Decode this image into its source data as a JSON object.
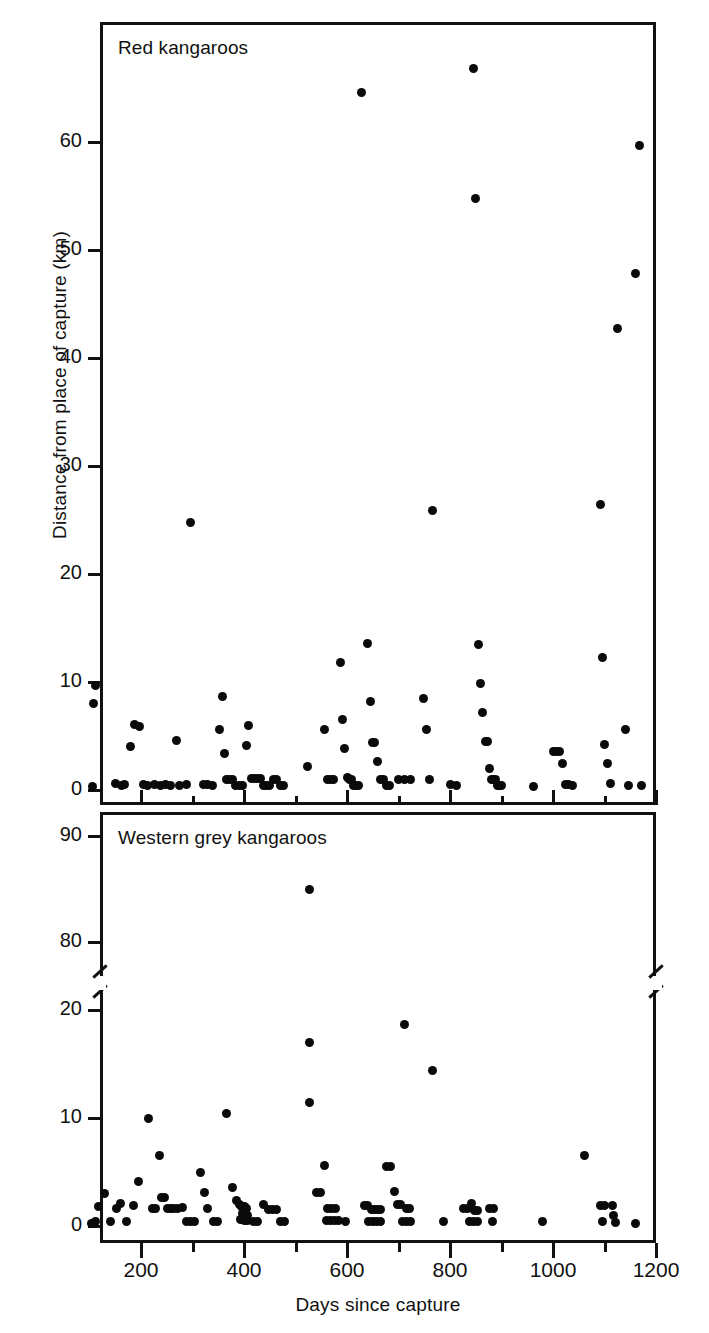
{
  "chart_data": {
    "type": "scatter",
    "title": "",
    "xlabel": "Days since capture",
    "ylabel": "Distance from place of capture (km)",
    "xlim": [
      100,
      1200
    ],
    "xticks": [
      200,
      400,
      600,
      800,
      1000,
      1200
    ],
    "xminorticks": [
      300,
      500,
      700,
      900,
      1100
    ],
    "grid": false,
    "legend_position": "none",
    "panels": [
      {
        "name": "red-kangaroos",
        "label": "Red kangaroos",
        "ylim": [
          0,
          68
        ],
        "yticks": [
          0,
          10,
          20,
          30,
          40,
          50,
          60
        ],
        "axis_break": false,
        "points": [
          [
            105,
            0.3
          ],
          [
            108,
            8.0
          ],
          [
            112,
            9.7
          ],
          [
            150,
            0.6
          ],
          [
            163,
            0.4
          ],
          [
            168,
            0.5
          ],
          [
            180,
            4.0
          ],
          [
            188,
            6.1
          ],
          [
            198,
            5.9
          ],
          [
            205,
            0.5
          ],
          [
            212,
            0.4
          ],
          [
            226,
            0.5
          ],
          [
            238,
            0.4
          ],
          [
            247,
            0.5
          ],
          [
            258,
            0.4
          ],
          [
            268,
            4.6
          ],
          [
            275,
            0.4
          ],
          [
            288,
            0.5
          ],
          [
            296,
            24.8
          ],
          [
            322,
            0.5
          ],
          [
            330,
            0.5
          ],
          [
            338,
            0.4
          ],
          [
            352,
            5.6
          ],
          [
            358,
            8.7
          ],
          [
            362,
            3.4
          ],
          [
            366,
            1.0
          ],
          [
            372,
            1.0
          ],
          [
            378,
            1.0
          ],
          [
            384,
            0.4
          ],
          [
            391,
            0.4
          ],
          [
            397,
            0.4
          ],
          [
            404,
            4.1
          ],
          [
            409,
            6.0
          ],
          [
            414,
            1.1
          ],
          [
            420,
            1.1
          ],
          [
            426,
            1.1
          ],
          [
            432,
            1.1
          ],
          [
            438,
            0.4
          ],
          [
            444,
            0.4
          ],
          [
            450,
            0.4
          ],
          [
            458,
            1.0
          ],
          [
            464,
            1.0
          ],
          [
            470,
            0.4
          ],
          [
            476,
            0.4
          ],
          [
            523,
            2.2
          ],
          [
            556,
            5.6
          ],
          [
            562,
            1.0
          ],
          [
            568,
            1.0
          ],
          [
            574,
            1.0
          ],
          [
            588,
            11.8
          ],
          [
            592,
            6.5
          ],
          [
            596,
            3.8
          ],
          [
            600,
            1.2
          ],
          [
            604,
            1.0
          ],
          [
            608,
            1.0
          ],
          [
            612,
            0.4
          ],
          [
            617,
            0.4
          ],
          [
            622,
            0.4
          ],
          [
            628,
            64.6
          ],
          [
            640,
            13.6
          ],
          [
            646,
            8.2
          ],
          [
            650,
            4.4
          ],
          [
            654,
            4.4
          ],
          [
            660,
            2.6
          ],
          [
            665,
            1.0
          ],
          [
            670,
            1.0
          ],
          [
            676,
            0.4
          ],
          [
            682,
            0.4
          ],
          [
            700,
            1.0
          ],
          [
            712,
            1.0
          ],
          [
            724,
            1.0
          ],
          [
            748,
            8.5
          ],
          [
            754,
            5.6
          ],
          [
            760,
            1.0
          ],
          [
            766,
            25.9
          ],
          [
            800,
            0.5
          ],
          [
            812,
            0.4
          ],
          [
            846,
            66.8
          ],
          [
            850,
            54.8
          ],
          [
            856,
            13.5
          ],
          [
            860,
            9.9
          ],
          [
            864,
            7.2
          ],
          [
            868,
            4.5
          ],
          [
            872,
            4.5
          ],
          [
            876,
            2.0
          ],
          [
            880,
            1.0
          ],
          [
            884,
            1.0
          ],
          [
            888,
            1.0
          ],
          [
            892,
            0.4
          ],
          [
            896,
            0.4
          ],
          [
            900,
            0.4
          ],
          [
            962,
            0.3
          ],
          [
            1000,
            3.6
          ],
          [
            1006,
            3.6
          ],
          [
            1012,
            3.6
          ],
          [
            1018,
            2.5
          ],
          [
            1024,
            0.5
          ],
          [
            1030,
            0.5
          ],
          [
            1038,
            0.4
          ],
          [
            1092,
            26.4
          ],
          [
            1096,
            12.3
          ],
          [
            1100,
            4.2
          ],
          [
            1106,
            2.5
          ],
          [
            1112,
            0.6
          ],
          [
            1126,
            42.7
          ],
          [
            1140,
            5.6
          ],
          [
            1146,
            0.4
          ],
          [
            1160,
            47.8
          ],
          [
            1168,
            59.7
          ],
          [
            1172,
            0.4
          ]
        ]
      },
      {
        "name": "western-grey-kangaroos",
        "label": "Western grey kangaroos",
        "ylim": [
          0,
          92
        ],
        "yticks": [
          0,
          10,
          20,
          80,
          90
        ],
        "axis_break": true,
        "break_between": [
          22,
          78
        ],
        "points": [
          [
            104,
            0.2
          ],
          [
            112,
            0.4
          ],
          [
            118,
            1.8
          ],
          [
            130,
            3.0
          ],
          [
            140,
            0.4
          ],
          [
            152,
            1.6
          ],
          [
            160,
            2.1
          ],
          [
            172,
            0.4
          ],
          [
            186,
            1.9
          ],
          [
            196,
            4.1
          ],
          [
            214,
            10.0
          ],
          [
            222,
            1.6
          ],
          [
            228,
            1.6
          ],
          [
            235,
            6.5
          ],
          [
            240,
            2.6
          ],
          [
            246,
            2.6
          ],
          [
            252,
            1.6
          ],
          [
            258,
            1.6
          ],
          [
            264,
            1.6
          ],
          [
            270,
            1.6
          ],
          [
            280,
            1.7
          ],
          [
            288,
            0.4
          ],
          [
            296,
            0.4
          ],
          [
            304,
            0.4
          ],
          [
            316,
            5.0
          ],
          [
            324,
            3.1
          ],
          [
            330,
            1.6
          ],
          [
            340,
            0.4
          ],
          [
            348,
            0.4
          ],
          [
            366,
            10.4
          ],
          [
            378,
            3.6
          ],
          [
            386,
            2.4
          ],
          [
            392,
            2.0
          ],
          [
            396,
            1.8
          ],
          [
            400,
            1.8
          ],
          [
            404,
            1.6
          ],
          [
            398,
            1.2
          ],
          [
            402,
            1.0
          ],
          [
            406,
            1.0
          ],
          [
            394,
            0.6
          ],
          [
            400,
            0.5
          ],
          [
            406,
            0.5
          ],
          [
            418,
            0.4
          ],
          [
            426,
            0.4
          ],
          [
            438,
            2.0
          ],
          [
            448,
            1.5
          ],
          [
            456,
            1.5
          ],
          [
            464,
            1.5
          ],
          [
            470,
            0.4
          ],
          [
            478,
            0.4
          ],
          [
            527,
            85.0
          ],
          [
            528,
            17.0
          ],
          [
            527,
            11.4
          ],
          [
            540,
            3.1
          ],
          [
            548,
            3.1
          ],
          [
            556,
            5.6
          ],
          [
            562,
            1.6
          ],
          [
            570,
            1.6
          ],
          [
            578,
            1.6
          ],
          [
            560,
            0.5
          ],
          [
            568,
            0.5
          ],
          [
            576,
            0.5
          ],
          [
            584,
            0.5
          ],
          [
            598,
            0.4
          ],
          [
            634,
            1.9
          ],
          [
            640,
            1.9
          ],
          [
            648,
            1.5
          ],
          [
            654,
            1.5
          ],
          [
            660,
            1.5
          ],
          [
            666,
            1.5
          ],
          [
            642,
            0.4
          ],
          [
            650,
            0.4
          ],
          [
            658,
            0.4
          ],
          [
            666,
            0.4
          ],
          [
            676,
            5.5
          ],
          [
            684,
            5.5
          ],
          [
            692,
            3.2
          ],
          [
            698,
            2.0
          ],
          [
            704,
            2.0
          ],
          [
            712,
            18.7
          ],
          [
            716,
            1.6
          ],
          [
            722,
            1.6
          ],
          [
            708,
            0.4
          ],
          [
            716,
            0.4
          ],
          [
            724,
            0.4
          ],
          [
            766,
            14.4
          ],
          [
            788,
            0.4
          ],
          [
            826,
            1.6
          ],
          [
            834,
            1.6
          ],
          [
            842,
            2.1
          ],
          [
            848,
            1.4
          ],
          [
            854,
            1.4
          ],
          [
            838,
            0.4
          ],
          [
            846,
            0.4
          ],
          [
            854,
            0.4
          ],
          [
            876,
            1.6
          ],
          [
            884,
            1.6
          ],
          [
            882,
            0.4
          ],
          [
            980,
            0.4
          ],
          [
            1062,
            6.5
          ],
          [
            1092,
            1.9
          ],
          [
            1100,
            1.9
          ],
          [
            1096,
            0.4
          ],
          [
            1116,
            1.9
          ],
          [
            1118,
            1.0
          ],
          [
            1122,
            0.3
          ],
          [
            1160,
            0.2
          ]
        ]
      }
    ]
  },
  "figure": {
    "ylabel": "Distance from place of capture (km)",
    "xlabel": "Days since capture",
    "panel_top_title": "Red kangaroos",
    "panel_bottom_title": "Western grey kangaroos",
    "xtick_labels": [
      "200",
      "400",
      "600",
      "800",
      "1000",
      "1200"
    ],
    "ytick_labels_top": [
      "0",
      "10",
      "20",
      "30",
      "40",
      "50",
      "60"
    ],
    "ytick_labels_bottom": [
      "0",
      "10",
      "20",
      "80",
      "90"
    ],
    "ink_color": "#111111",
    "paper_color": "#ffffff"
  }
}
